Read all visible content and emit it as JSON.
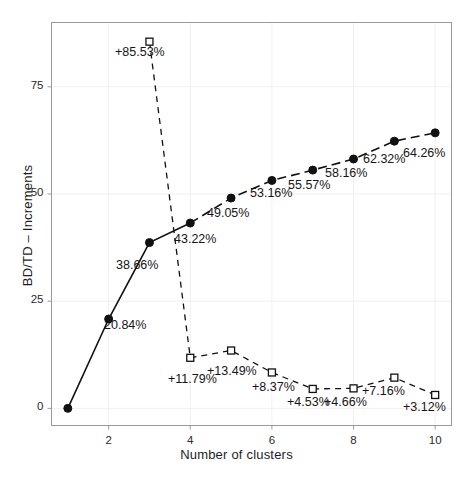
{
  "chart_data": {
    "type": "line",
    "title": "",
    "xlabel": "Number of clusters",
    "ylabel": "BD/TD – Increments",
    "x": [
      1,
      2,
      3,
      4,
      5,
      6,
      7,
      8,
      9,
      10
    ],
    "xlim": [
      0.6,
      10.4
    ],
    "ylim": [
      -4,
      90
    ],
    "xticks": [
      2,
      4,
      6,
      8,
      10
    ],
    "xticklabels": [
      "2",
      "4",
      "6",
      "8",
      "10"
    ],
    "yticks": [
      0,
      25,
      50,
      75
    ],
    "yticklabels": [
      "0",
      "25",
      "50",
      "75"
    ],
    "grid": true,
    "legend": "none",
    "series": [
      {
        "name": "BD/TD",
        "marker": "filled-circle",
        "linestyle": "solid-then-dashed",
        "x": [
          1,
          2,
          3,
          4,
          5,
          6,
          7,
          8,
          9,
          10
        ],
        "values": [
          0,
          20.84,
          38.66,
          43.22,
          49.05,
          53.16,
          55.57,
          58.16,
          62.32,
          64.26
        ],
        "labels": [
          "",
          "20.84%",
          "38.66%",
          "43.22%",
          "49.05%",
          "53.16%",
          "55.57%",
          "58.16%",
          "62.32%",
          "64.26%"
        ]
      },
      {
        "name": "Increments",
        "marker": "open-square",
        "linestyle": "dashed",
        "x": [
          3,
          4,
          5,
          6,
          7,
          8,
          9,
          10
        ],
        "values": [
          85.53,
          11.79,
          13.49,
          8.37,
          4.53,
          4.66,
          7.16,
          3.12
        ],
        "labels": [
          "+85.53%",
          "+11.79%",
          "+13.49%",
          "+8.37%",
          "+4.53%",
          "+4.66%",
          "+7.16%",
          "+3.12%"
        ]
      }
    ],
    "colors": {
      "line": "#111111",
      "marker_fill": "#111111",
      "marker_open": "#ffffff",
      "frame": "#9a9a9a",
      "grid": "#f0f0f0",
      "text": "#1a1a1a"
    }
  },
  "annotations": {
    "bdtd": [
      {
        "text": "20.84%",
        "x": 104,
        "y": 318
      },
      {
        "text": "38.66%",
        "x": 116,
        "y": 258
      },
      {
        "text": "43.22%",
        "x": 174,
        "y": 232
      },
      {
        "text": "49.05%",
        "x": 207,
        "y": 206
      },
      {
        "text": "53.16%",
        "x": 250,
        "y": 186
      },
      {
        "text": "55.57%",
        "x": 288,
        "y": 178
      },
      {
        "text": "58.16%",
        "x": 325,
        "y": 166
      },
      {
        "text": "62.32%",
        "x": 363,
        "y": 152
      },
      {
        "text": "64.26%",
        "x": 403,
        "y": 146
      }
    ],
    "increments": [
      {
        "text": "+85.53%",
        "x": 115,
        "y": 45
      },
      {
        "text": "+11.79%",
        "x": 168,
        "y": 372
      },
      {
        "text": "+13.49%",
        "x": 207,
        "y": 364
      },
      {
        "text": "+8.37%",
        "x": 252,
        "y": 380
      },
      {
        "text": "+4.53%",
        "x": 287,
        "y": 395
      },
      {
        "text": "+4.66%",
        "x": 324,
        "y": 395
      },
      {
        "text": "+7.16%",
        "x": 362,
        "y": 384
      },
      {
        "text": "+3.12%",
        "x": 403,
        "y": 400
      }
    ]
  },
  "axis_ticks": {
    "y": [
      {
        "label": "0",
        "y": 403
      },
      {
        "label": "25",
        "y": 302
      },
      {
        "label": "50",
        "y": 201
      },
      {
        "label": "75",
        "y": 100
      }
    ],
    "x": [
      {
        "label": "2",
        "x": 132
      },
      {
        "label": "4",
        "x": 220
      },
      {
        "label": "6",
        "x": 308
      },
      {
        "label": "8",
        "x": 396
      },
      {
        "label": "10",
        "x": 441
      }
    ]
  }
}
